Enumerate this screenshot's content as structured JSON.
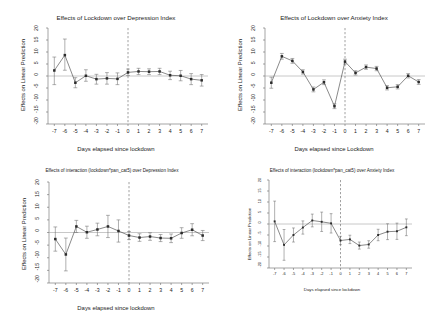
{
  "figure": {
    "panel_count": 4,
    "background": "#ffffff"
  },
  "chart_data": [
    {
      "id": "top-left",
      "type": "line",
      "title": "Effects of Lockdown over Depression Index",
      "xlabel": "Days elapsed since lockdown",
      "ylabel": "Effects on Linear Prediction",
      "x": [
        -7,
        -6,
        -5,
        -4,
        -3,
        -2,
        -1,
        0,
        1,
        2,
        3,
        4,
        5,
        6,
        7
      ],
      "xtick_labels": [
        "-7",
        "-6",
        "-5",
        "-4",
        "-3",
        "-2",
        "-1",
        "0",
        "1",
        "2",
        "3",
        "4",
        "5",
        "6",
        "7"
      ],
      "ytick_labels": [
        "-20",
        "-15",
        "-10",
        "-5",
        "0",
        "5",
        "10",
        "15",
        "20"
      ],
      "ytick_values": [
        -20,
        -15,
        -10,
        -5,
        0,
        5,
        10,
        15,
        20
      ],
      "ylim": [
        -20,
        20
      ],
      "xlim": [
        -7.6,
        7.6
      ],
      "values": [
        2.3,
        8.7,
        -2.8,
        0.1,
        -1.3,
        -1.0,
        -1.2,
        1.5,
        1.9,
        1.8,
        1.9,
        0.3,
        0.1,
        -1.3,
        -1.8
      ],
      "ci_low": [
        -3.6,
        2.4,
        -4.9,
        -2.2,
        -3.4,
        -3.4,
        -3.6,
        0.2,
        0.6,
        0.6,
        0.6,
        -1.5,
        -2.0,
        -3.6,
        -4.2
      ],
      "ci_high": [
        7.9,
        15.4,
        -0.7,
        2.6,
        0.7,
        1.4,
        1.3,
        2.9,
        3.2,
        3.0,
        3.2,
        2.0,
        2.3,
        1.0,
        0.6
      ],
      "reference_line_x": 0,
      "zero_line": true,
      "grid": false,
      "legend": "none"
    },
    {
      "id": "top-right",
      "type": "line",
      "title": "Effects of Lockdown over Anxiety Index",
      "xlabel": "Days elapsed since Lockdown",
      "ylabel": "Effects on Linear Prediction",
      "x": [
        -7,
        -6,
        -5,
        -4,
        -3,
        -2,
        -1,
        0,
        1,
        2,
        3,
        4,
        5,
        6,
        7
      ],
      "xtick_labels": [
        "-7",
        "-6",
        "-5",
        "-4",
        "-3",
        "-2",
        "-1",
        "0",
        "1",
        "2",
        "3",
        "4",
        "5",
        "6",
        "7"
      ],
      "ytick_labels": [
        "-20",
        "-15",
        "-10",
        "-5",
        "0",
        "5",
        "10",
        "15",
        "20"
      ],
      "ytick_values": [
        -20,
        -15,
        -10,
        -5,
        0,
        5,
        10,
        15,
        20
      ],
      "ylim": [
        -20,
        20
      ],
      "xlim": [
        -7.6,
        7.6
      ],
      "values": [
        -2.8,
        8.2,
        6.3,
        1.7,
        -5.6,
        -2.6,
        -12.6,
        6.0,
        1.3,
        3.7,
        3.1,
        -4.9,
        -4.5,
        0.1,
        -2.5
      ],
      "ci_low": [
        -5.1,
        7.0,
        5.3,
        0.8,
        -6.6,
        -3.6,
        -13.6,
        5.0,
        0.4,
        2.8,
        2.2,
        -5.8,
        -5.4,
        -0.8,
        -3.5
      ],
      "ci_high": [
        -0.5,
        9.4,
        7.3,
        2.6,
        -4.6,
        -1.6,
        -11.6,
        7.0,
        2.2,
        4.6,
        4.0,
        -4.0,
        -3.6,
        1.0,
        -1.5
      ],
      "reference_line_x": 0,
      "zero_line": true,
      "grid": false,
      "legend": "none"
    },
    {
      "id": "bottom-left",
      "type": "line",
      "title": "Effects of interaction (lockdown*pan_cat5) over Depression Index",
      "xlabel": "Days elapsed since lockdown",
      "ylabel": "Effects on Linear Prediction",
      "x": [
        -7,
        -6,
        -5,
        -4,
        -3,
        -2,
        -1,
        0,
        1,
        2,
        3,
        4,
        5,
        6,
        7
      ],
      "xtick_labels": [
        "-7",
        "-6",
        "-5",
        "-4",
        "-3",
        "-2",
        "-1",
        "0",
        "1",
        "2",
        "3",
        "4",
        "5",
        "6",
        "7"
      ],
      "ytick_labels": [
        "-20",
        "-15",
        "-10",
        "-5",
        "0",
        "5",
        "10",
        "15",
        "20"
      ],
      "ytick_values": [
        -20,
        -15,
        -10,
        -5,
        0,
        5,
        10,
        15,
        20
      ],
      "ylim": [
        -20,
        20
      ],
      "xlim": [
        -7.6,
        7.6
      ],
      "values": [
        -2.6,
        -8.7,
        2.4,
        0.1,
        1.2,
        2.4,
        0.6,
        -1.2,
        -2.0,
        -1.6,
        -2.2,
        -2.3,
        -0.2,
        1.1,
        -1.2
      ],
      "ci_low": [
        -7.4,
        -15.2,
        0.0,
        -2.3,
        -1.3,
        -2.0,
        -3.8,
        -2.8,
        -3.5,
        -3.1,
        -3.6,
        -4.0,
        -2.3,
        -1.3,
        -3.2
      ],
      "ci_high": [
        2.2,
        -2.2,
        4.8,
        2.5,
        3.7,
        6.8,
        5.0,
        0.4,
        -0.5,
        -0.1,
        -0.8,
        -0.6,
        1.9,
        3.5,
        0.8
      ],
      "reference_line_x": 0,
      "zero_line": true,
      "grid": false,
      "legend": "none"
    },
    {
      "id": "bottom-right",
      "type": "line",
      "title": "Effects of interaction (lockdown*pan_cat5) over Anxiety Index",
      "xlabel": "Days elapsed since lockdown",
      "ylabel": "Effects on Linear Prediction",
      "x": [
        -7,
        -6,
        -5,
        -4,
        -3,
        -2,
        -1,
        0,
        1,
        2,
        3,
        4,
        5,
        6,
        7
      ],
      "xtick_labels": [
        "-7",
        "-6",
        "-5",
        "-4",
        "-3",
        "-2",
        "-1",
        "0",
        "1",
        "2",
        "3",
        "4",
        "5",
        "6",
        "7"
      ],
      "ytick_labels": [
        "-20",
        "-15",
        "-10",
        "-5",
        "0",
        "5",
        "10",
        "15",
        "20"
      ],
      "ytick_values": [
        -20,
        -15,
        -10,
        -5,
        0,
        5,
        10,
        15,
        20
      ],
      "ylim": [
        -20,
        20
      ],
      "xlim": [
        -7.6,
        7.6
      ],
      "values": [
        1.2,
        -9.5,
        -5.0,
        -1.6,
        1.6,
        1.0,
        0.3,
        -7.5,
        -7.0,
        -9.8,
        -9.3,
        -5.0,
        -3.5,
        -3.3,
        -1.5
      ],
      "ci_low": [
        -8.0,
        -16.5,
        -8.2,
        -4.6,
        -1.3,
        -3.4,
        -4.1,
        -9.4,
        -8.9,
        -11.4,
        -11.0,
        -7.6,
        -7.1,
        -7.0,
        -5.3
      ],
      "ci_high": [
        10.4,
        -2.5,
        -1.8,
        1.4,
        4.5,
        5.4,
        4.7,
        -5.6,
        -5.1,
        -8.2,
        -7.6,
        -2.4,
        0.1,
        0.4,
        2.3
      ],
      "reference_line_x": 0,
      "zero_line": true,
      "grid": false,
      "legend": "none"
    }
  ]
}
